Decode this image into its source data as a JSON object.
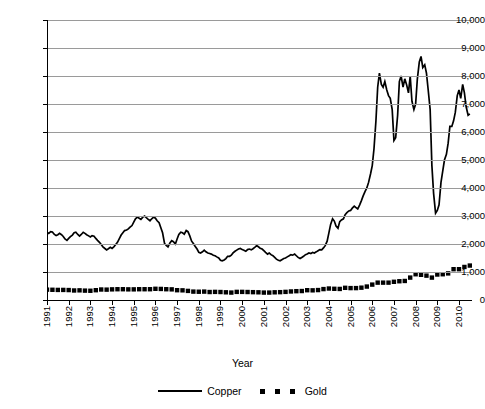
{
  "chart_data": {
    "type": "line",
    "title": "",
    "xlabel": "Year",
    "ylabel": "",
    "ylim": [
      0,
      10000
    ],
    "xlim": [
      1991,
      2010.6
    ],
    "grid": true,
    "legend_position": "bottom",
    "ytick_labels": [
      "10,000",
      "9,000",
      "8,000",
      "7,000",
      "6,000",
      "5,000",
      "4,000",
      "3,000",
      "2,000",
      "1,000",
      "0"
    ],
    "ytick_values": [
      10000,
      9000,
      8000,
      7000,
      6000,
      5000,
      4000,
      3000,
      2000,
      1000,
      0
    ],
    "xtick_labels": [
      "1991",
      "1992",
      "1993",
      "1994",
      "1995",
      "1996",
      "1997",
      "1998",
      "1999",
      "2000",
      "2001",
      "2002",
      "2003",
      "2004",
      "2005",
      "2006",
      "2007",
      "2008",
      "2009",
      "2010"
    ],
    "xtick_values": [
      1991,
      1992,
      1993,
      1994,
      1995,
      1996,
      1997,
      1998,
      1999,
      2000,
      2001,
      2002,
      2003,
      2004,
      2005,
      2006,
      2007,
      2008,
      2009,
      2010
    ],
    "series": [
      {
        "name": "Copper",
        "style": "solid-line",
        "color": "#000000",
        "x": [
          1991.0,
          1991.08,
          1991.17,
          1991.25,
          1991.33,
          1991.42,
          1991.5,
          1991.58,
          1991.67,
          1991.75,
          1991.83,
          1991.92,
          1992.0,
          1992.08,
          1992.17,
          1992.25,
          1992.33,
          1992.42,
          1992.5,
          1992.58,
          1992.67,
          1992.75,
          1992.83,
          1992.92,
          1993.0,
          1993.08,
          1993.17,
          1993.25,
          1993.33,
          1993.42,
          1993.5,
          1993.58,
          1993.67,
          1993.75,
          1993.83,
          1993.92,
          1994.0,
          1994.08,
          1994.17,
          1994.25,
          1994.33,
          1994.42,
          1994.5,
          1994.58,
          1994.67,
          1994.75,
          1994.83,
          1994.92,
          1995.0,
          1995.08,
          1995.17,
          1995.25,
          1995.33,
          1995.42,
          1995.5,
          1995.58,
          1995.67,
          1995.75,
          1995.83,
          1995.92,
          1996.0,
          1996.08,
          1996.17,
          1996.25,
          1996.33,
          1996.42,
          1996.5,
          1996.58,
          1996.67,
          1996.75,
          1996.83,
          1996.92,
          1997.0,
          1997.08,
          1997.17,
          1997.25,
          1997.33,
          1997.42,
          1997.5,
          1997.58,
          1997.67,
          1997.75,
          1997.83,
          1997.92,
          1998.0,
          1998.08,
          1998.17,
          1998.25,
          1998.33,
          1998.42,
          1998.5,
          1998.58,
          1998.67,
          1998.75,
          1998.83,
          1998.92,
          1999.0,
          1999.08,
          1999.17,
          1999.25,
          1999.33,
          1999.42,
          1999.5,
          1999.58,
          1999.67,
          1999.75,
          1999.83,
          1999.92,
          2000.0,
          2000.08,
          2000.17,
          2000.25,
          2000.33,
          2000.42,
          2000.5,
          2000.58,
          2000.67,
          2000.75,
          2000.83,
          2000.92,
          2001.0,
          2001.08,
          2001.17,
          2001.25,
          2001.33,
          2001.42,
          2001.5,
          2001.58,
          2001.67,
          2001.75,
          2001.83,
          2001.92,
          2002.0,
          2002.08,
          2002.17,
          2002.25,
          2002.33,
          2002.42,
          2002.5,
          2002.58,
          2002.67,
          2002.75,
          2002.83,
          2002.92,
          2003.0,
          2003.08,
          2003.17,
          2003.25,
          2003.33,
          2003.42,
          2003.5,
          2003.58,
          2003.67,
          2003.75,
          2003.83,
          2003.92,
          2004.0,
          2004.08,
          2004.17,
          2004.25,
          2004.33,
          2004.42,
          2004.5,
          2004.58,
          2004.67,
          2004.75,
          2004.83,
          2004.92,
          2005.0,
          2005.08,
          2005.17,
          2005.25,
          2005.33,
          2005.42,
          2005.5,
          2005.58,
          2005.67,
          2005.75,
          2005.83,
          2005.92,
          2006.0,
          2006.08,
          2006.17,
          2006.25,
          2006.33,
          2006.42,
          2006.5,
          2006.58,
          2006.67,
          2006.75,
          2006.83,
          2006.92,
          2007.0,
          2007.08,
          2007.17,
          2007.25,
          2007.33,
          2007.42,
          2007.5,
          2007.58,
          2007.67,
          2007.75,
          2007.83,
          2007.92,
          2008.0,
          2008.08,
          2008.17,
          2008.25,
          2008.33,
          2008.42,
          2008.5,
          2008.58,
          2008.67,
          2008.75,
          2008.83,
          2008.92,
          2009.0,
          2009.08,
          2009.17,
          2009.25,
          2009.33,
          2009.42,
          2009.5,
          2009.58,
          2009.67,
          2009.75,
          2009.83,
          2009.92,
          2010.0,
          2010.08,
          2010.17,
          2010.25,
          2010.33,
          2010.42,
          2010.5
        ],
        "values": [
          2420,
          2380,
          2440,
          2430,
          2350,
          2300,
          2330,
          2380,
          2330,
          2270,
          2180,
          2130,
          2200,
          2260,
          2320,
          2400,
          2420,
          2340,
          2280,
          2340,
          2420,
          2380,
          2330,
          2290,
          2250,
          2300,
          2280,
          2200,
          2130,
          2060,
          1980,
          1900,
          1840,
          1790,
          1830,
          1880,
          1840,
          1900,
          1980,
          2060,
          2180,
          2320,
          2400,
          2480,
          2500,
          2540,
          2600,
          2660,
          2780,
          2900,
          2960,
          2920,
          2880,
          2960,
          3000,
          2940,
          2880,
          2830,
          2900,
          2960,
          2920,
          2830,
          2760,
          2580,
          2400,
          2020,
          1950,
          1900,
          2040,
          2120,
          2080,
          2000,
          2180,
          2340,
          2420,
          2400,
          2350,
          2480,
          2440,
          2300,
          2100,
          2020,
          1920,
          1820,
          1700,
          1680,
          1720,
          1780,
          1720,
          1680,
          1660,
          1640,
          1600,
          1580,
          1540,
          1500,
          1420,
          1400,
          1430,
          1480,
          1560,
          1560,
          1600,
          1680,
          1740,
          1780,
          1820,
          1840,
          1800,
          1780,
          1740,
          1800,
          1820,
          1790,
          1830,
          1880,
          1940,
          1900,
          1850,
          1820,
          1760,
          1700,
          1640,
          1680,
          1620,
          1580,
          1520,
          1460,
          1420,
          1400,
          1440,
          1480,
          1500,
          1540,
          1580,
          1620,
          1600,
          1640,
          1580,
          1520,
          1480,
          1520,
          1560,
          1620,
          1640,
          1680,
          1660,
          1700,
          1680,
          1720,
          1760,
          1800,
          1790,
          1860,
          1940,
          2100,
          2400,
          2700,
          2900,
          2820,
          2640,
          2560,
          2800,
          2860,
          2900,
          3050,
          3120,
          3180,
          3200,
          3280,
          3350,
          3300,
          3250,
          3400,
          3550,
          3720,
          3880,
          4000,
          4200,
          4500,
          4800,
          5400,
          6400,
          7600,
          8100,
          7700,
          7600,
          7800,
          7500,
          7300,
          7200,
          6800,
          5700,
          5800,
          6600,
          7800,
          8000,
          7600,
          7900,
          7700,
          7400,
          8000,
          7100,
          6800,
          7000,
          7900,
          8500,
          8700,
          8300,
          8400,
          8100,
          7500,
          6800,
          4800,
          3800,
          3100,
          3200,
          3400,
          4200,
          4600,
          5000,
          5200,
          5600,
          6200,
          6200,
          6400,
          6700,
          7300,
          7500,
          7200,
          7700,
          7400,
          6900,
          6600,
          6650
        ]
      },
      {
        "name": "Gold",
        "style": "dotted-square",
        "color": "#000000",
        "x": [
          1991.0,
          1991.25,
          1991.5,
          1991.75,
          1992.0,
          1992.25,
          1992.5,
          1992.75,
          1993.0,
          1993.25,
          1993.5,
          1993.75,
          1994.0,
          1994.25,
          1994.5,
          1994.75,
          1995.0,
          1995.25,
          1995.5,
          1995.75,
          1996.0,
          1996.25,
          1996.5,
          1996.75,
          1997.0,
          1997.25,
          1997.5,
          1997.75,
          1998.0,
          1998.25,
          1998.5,
          1998.75,
          1999.0,
          1999.25,
          1999.5,
          1999.75,
          2000.0,
          2000.25,
          2000.5,
          2000.75,
          2001.0,
          2001.25,
          2001.5,
          2001.75,
          2002.0,
          2002.25,
          2002.5,
          2002.75,
          2003.0,
          2003.25,
          2003.5,
          2003.75,
          2004.0,
          2004.25,
          2004.5,
          2004.75,
          2005.0,
          2005.25,
          2005.5,
          2005.75,
          2006.0,
          2006.25,
          2006.5,
          2006.75,
          2007.0,
          2007.25,
          2007.5,
          2007.75,
          2008.0,
          2008.25,
          2008.5,
          2008.75,
          2009.0,
          2009.25,
          2009.5,
          2009.75,
          2010.0,
          2010.25,
          2010.5
        ],
        "values": [
          370,
          365,
          360,
          360,
          355,
          340,
          345,
          335,
          330,
          350,
          375,
          370,
          380,
          385,
          385,
          380,
          380,
          385,
          385,
          385,
          400,
          395,
          385,
          380,
          350,
          345,
          325,
          300,
          295,
          300,
          285,
          290,
          285,
          275,
          265,
          290,
          290,
          285,
          280,
          275,
          265,
          265,
          275,
          280,
          290,
          305,
          315,
          320,
          350,
          345,
          355,
          390,
          410,
          400,
          395,
          435,
          425,
          425,
          440,
          480,
          550,
          620,
          620,
          620,
          650,
          670,
          680,
          800,
          920,
          900,
          870,
          800,
          910,
          920,
          950,
          1100,
          1100,
          1180,
          1230
        ]
      }
    ]
  },
  "legend": {
    "items": [
      {
        "label": "Copper",
        "marker": "solid-line"
      },
      {
        "label": "Gold",
        "marker": "dotted-square"
      }
    ]
  },
  "axis": {
    "x_title": "Year"
  }
}
